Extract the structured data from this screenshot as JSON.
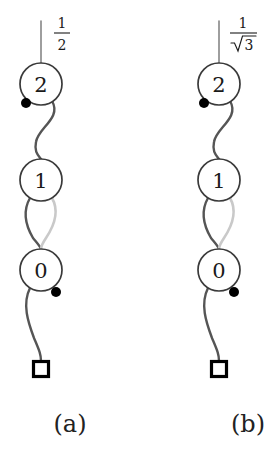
{
  "figure": {
    "type": "spin-network-diagram",
    "background_color": "#ffffff",
    "ink_color": "#3a3a3a",
    "text_color": "#1a1a1a",
    "highlight_color": "#c9c9c9",
    "dot_color": "#000000",
    "panel_count": 2
  },
  "panels": [
    {
      "id": "a",
      "caption": "(a)",
      "caption_x": 70,
      "caption_y": 424,
      "center_x": 41,
      "edge_label": {
        "numerator": "1",
        "denominator": "2",
        "denominator_has_radical": false,
        "x": 62,
        "y": 34
      },
      "nodes": [
        {
          "label": "2",
          "cx": 41,
          "cy": 84,
          "r": 21,
          "shape": "circle"
        },
        {
          "label": "1",
          "cx": 41,
          "cy": 180,
          "r": 21,
          "shape": "circle"
        },
        {
          "label": "0",
          "cx": 41,
          "cy": 270,
          "r": 21,
          "shape": "circle"
        }
      ],
      "terminal": {
        "shape": "square",
        "cx": 41,
        "cy": 369,
        "size": 15
      },
      "dots": [
        {
          "name": "dot-upper",
          "cx": 26,
          "cy": 103,
          "r": 5
        },
        {
          "name": "dot-lower",
          "cx": 56,
          "cy": 292,
          "r": 5
        }
      ],
      "stem": {
        "x": 41,
        "y_top": 21,
        "y_bottom": 63
      }
    },
    {
      "id": "b",
      "caption": "(b)",
      "caption_x": 248,
      "caption_y": 424,
      "center_x": 219,
      "edge_label": {
        "numerator": "1",
        "denominator": "3",
        "denominator_has_radical": true,
        "x": 240,
        "y": 34
      },
      "nodes": [
        {
          "label": "2",
          "cx": 219,
          "cy": 84,
          "r": 21,
          "shape": "circle"
        },
        {
          "label": "1",
          "cx": 219,
          "cy": 180,
          "r": 21,
          "shape": "circle"
        },
        {
          "label": "0",
          "cx": 219,
          "cy": 270,
          "r": 21,
          "shape": "circle"
        }
      ],
      "terminal": {
        "shape": "square",
        "cx": 219,
        "cy": 369,
        "size": 15
      },
      "dots": [
        {
          "name": "dot-upper",
          "cx": 204,
          "cy": 103,
          "r": 5
        },
        {
          "name": "dot-lower",
          "cx": 234,
          "cy": 292,
          "r": 5
        }
      ],
      "stem": {
        "x": 219,
        "y_top": 21,
        "y_bottom": 63
      }
    }
  ]
}
